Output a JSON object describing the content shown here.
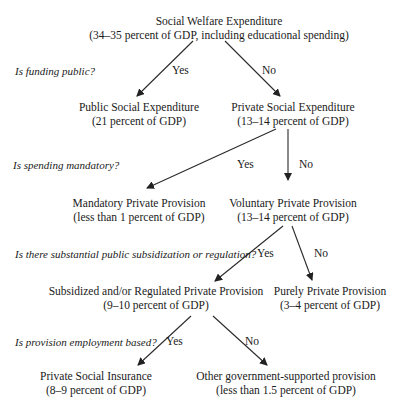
{
  "nodes": {
    "root": {
      "title": "Social Welfare Expenditure",
      "value": "(34–35 percent of GDP, including educational spending)"
    },
    "public": {
      "title": "Public Social Expenditure",
      "value": "(21 percent of GDP)"
    },
    "private": {
      "title": "Private Social Expenditure",
      "value": "(13–14 percent of GDP)"
    },
    "mandatory": {
      "title": "Mandatory Private Provision",
      "value": "(less than 1 percent of GDP)"
    },
    "voluntary": {
      "title": "Voluntary Private Provision",
      "value": "(13–14 percent of GDP)"
    },
    "subsidized": {
      "title": "Subsidized and/or Regulated Private Provision",
      "value": "(9–10 percent of GDP)"
    },
    "purely": {
      "title": "Purely Private Provision",
      "value": "(3–4 percent of GDP)"
    },
    "insurance": {
      "title": "Private Social Insurance",
      "value": "(8–9 percent of GDP)"
    },
    "other": {
      "title": "Other government-supported provision",
      "value": "(less than 1.5 percent of GDP)"
    }
  },
  "questions": {
    "q1": "Is funding public?",
    "q2": "Is spending mandatory?",
    "q3": "Is there substantial public subsidization or regulation?",
    "q4": "Is provision employment based?"
  },
  "edges": {
    "yes": "Yes",
    "no": "No"
  },
  "colors": {
    "line": "#2a2a2a",
    "text": "#1a1a1a"
  }
}
